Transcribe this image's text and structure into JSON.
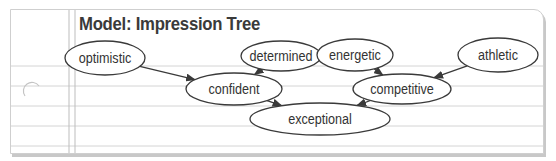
{
  "title": "Model: Impression Tree",
  "nodes": {
    "optimistic": {
      "label": "optimistic",
      "cx": 105,
      "cy": 58,
      "rx": 40,
      "ry": 17
    },
    "determined": {
      "label": "determined",
      "cx": 281,
      "cy": 56,
      "rx": 40,
      "ry": 15
    },
    "energetic": {
      "label": "energetic",
      "cx": 355,
      "cy": 55,
      "rx": 38,
      "ry": 16
    },
    "athletic": {
      "label": "athletic",
      "cx": 498,
      "cy": 55,
      "rx": 40,
      "ry": 17
    },
    "confident": {
      "label": "confident",
      "cx": 234,
      "cy": 89,
      "rx": 48,
      "ry": 16
    },
    "competitive": {
      "label": "competitive",
      "cx": 402,
      "cy": 89,
      "rx": 49,
      "ry": 15
    },
    "exceptional": {
      "label": "exceptional",
      "cx": 320,
      "cy": 119,
      "rx": 70,
      "ry": 16
    }
  },
  "edges": [
    {
      "from": "optimistic",
      "to": "confident"
    },
    {
      "from": "determined",
      "to": "confident"
    },
    {
      "from": "energetic",
      "to": "competitive"
    },
    {
      "from": "athletic",
      "to": "competitive"
    },
    {
      "from": "confident",
      "to": "exceptional"
    },
    {
      "from": "competitive",
      "to": "exceptional"
    }
  ],
  "colors": {
    "stroke": "#3a3a3a",
    "ruled_line": "#d4d4d4",
    "margin_line": "#bdbdbd"
  }
}
